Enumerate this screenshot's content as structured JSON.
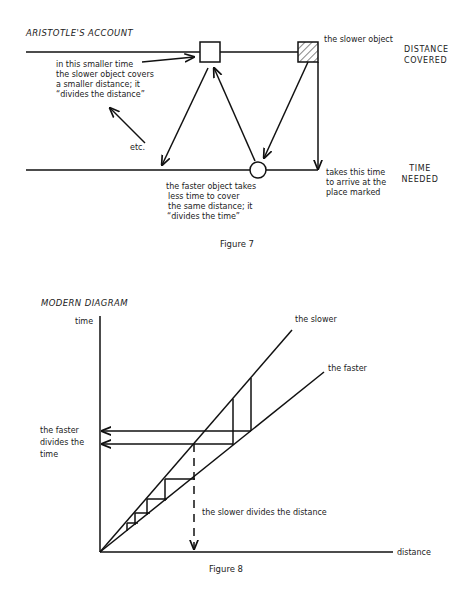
{
  "figure7": {
    "title": "ARISTOTLE'S ACCOUNT",
    "top_label": [
      "DISTANCE",
      "COVERED"
    ],
    "bottom_label": [
      "TIME",
      "NEEDED"
    ],
    "slower_object_label": "the slower object",
    "left_note": [
      "in this smaller time",
      "the slower object covers",
      "a smaller distance; it",
      "“divides the distance”"
    ],
    "etc_label": "etc.",
    "bottom_note": [
      "the faster object takes",
      "less time to cover",
      "the same distance; it",
      "“divides the time”"
    ],
    "right_note": [
      "takes this time",
      "to arrive at the",
      "place marked"
    ],
    "caption": "Figure 7"
  },
  "figure8": {
    "title": "MODERN DIAGRAM",
    "y_axis_label": "time",
    "x_axis_label": "distance",
    "slower_label": "the slower",
    "faster_label": "the faster",
    "faster_divides_label": [
      "the faster",
      "divides the",
      "time"
    ],
    "slower_divides_label": "the slower divides the distance",
    "caption": "Figure 8"
  }
}
